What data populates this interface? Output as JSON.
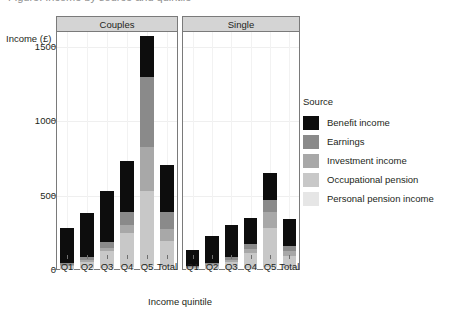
{
  "figure": {
    "title_clipped": "Figure: Income by source and quintile",
    "ylabel": "Income (£)",
    "xlabel": "Income quintile"
  },
  "legend": {
    "title": "Source",
    "items": [
      {
        "label": "Benefit income",
        "color": "#0d0d0d"
      },
      {
        "label": "Earnings",
        "color": "#8a8a8a"
      },
      {
        "label": "Investment income",
        "color": "#a8a8a8"
      },
      {
        "label": "Occupational pension",
        "color": "#c8c8c8"
      },
      {
        "label": "Personal pension income",
        "color": "#e6e6e6"
      }
    ]
  },
  "chart_data": {
    "type": "bar",
    "stacked": true,
    "xlabel": "Income quintile",
    "ylabel": "Income (£)",
    "ylim": [
      0,
      1600
    ],
    "yticks": [
      0,
      500,
      1000,
      1500
    ],
    "ytick_labels": [
      "0",
      "500",
      "1000",
      "1500"
    ],
    "grid": true,
    "legend_position": "right",
    "panels": [
      "Couples",
      "Single"
    ],
    "categories": [
      "Q1",
      "Q2",
      "Q3",
      "Q4",
      "Q5",
      "Total"
    ],
    "series": [
      {
        "name": "Personal pension income",
        "color": "#e6e6e6",
        "values": {
          "Couples": [
            10,
            12,
            15,
            20,
            30,
            18
          ],
          "Single": [
            6,
            8,
            10,
            12,
            20,
            11
          ]
        }
      },
      {
        "name": "Occupational pension",
        "color": "#c8c8c8",
        "values": {
          "Couples": [
            15,
            40,
            110,
            230,
            500,
            180
          ],
          "Single": [
            8,
            20,
            45,
            100,
            260,
            85
          ]
        }
      },
      {
        "name": "Investment income",
        "color": "#a8a8a8",
        "values": {
          "Couples": [
            10,
            15,
            25,
            55,
            295,
            80
          ],
          "Single": [
            6,
            10,
            15,
            30,
            110,
            35
          ]
        }
      },
      {
        "name": "Earnings",
        "color": "#8a8a8a",
        "values": {
          "Couples": [
            10,
            20,
            40,
            85,
            470,
            115
          ],
          "Single": [
            5,
            10,
            15,
            35,
            80,
            30
          ]
        }
      },
      {
        "name": "Benefit income",
        "color": "#0d0d0d",
        "values": {
          "Couples": [
            235,
            295,
            340,
            340,
            275,
            315
          ],
          "Single": [
            110,
            180,
            215,
            175,
            185,
            180
          ]
        }
      }
    ],
    "totals": {
      "Couples": [
        280,
        382,
        530,
        730,
        1570,
        708
      ],
      "Single": [
        135,
        228,
        300,
        352,
        655,
        341
      ]
    }
  }
}
